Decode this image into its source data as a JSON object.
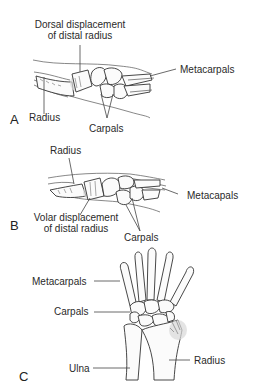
{
  "figure": {
    "panels": [
      {
        "letter": "A",
        "labels": {
          "top": [
            "Dorsal displacement",
            "of distal radius"
          ],
          "metacarpals": "Metacarpals",
          "radius": "Radius",
          "carpals": "Carpals"
        }
      },
      {
        "letter": "B",
        "labels": {
          "radius": "Radius",
          "metacarpals": "Metacapals",
          "bottom": [
            "Volar displacement",
            "of distal radius"
          ],
          "carpals": "Carpals"
        }
      },
      {
        "letter": "C",
        "labels": {
          "metacarpals": "Metacarpals",
          "carpals": "Carpals",
          "ulna": "Ulna",
          "radius": "Radius"
        }
      }
    ],
    "colors": {
      "ink": "#333333",
      "highlight": "#d9d9d9",
      "background": "#ffffff"
    }
  }
}
